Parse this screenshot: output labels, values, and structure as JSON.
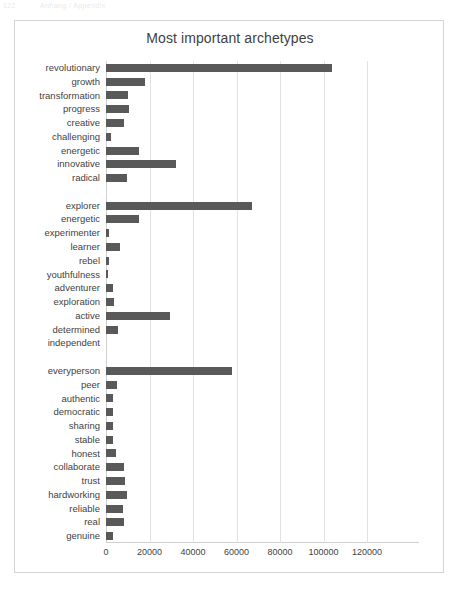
{
  "page_artifact": {
    "number": "122",
    "text": "Anhang / Appendix"
  },
  "chart_data": {
    "type": "bar",
    "orientation": "horizontal",
    "title": "Most important archetypes",
    "xlabel": "",
    "ylabel": "",
    "xlim": [
      0,
      120000
    ],
    "xticks": [
      0,
      20000,
      40000,
      60000,
      80000,
      100000,
      120000
    ],
    "xtick_labels": [
      "0",
      "20000",
      "40000",
      "60000",
      "80000",
      "100000",
      "120000"
    ],
    "grid": "vertical",
    "legend": "none",
    "bar_color": "#595959",
    "gridline_color": "#e2e2e2",
    "plot_border_color": "#d4d4d4",
    "groups": [
      {
        "name": "revolutionary-group",
        "categories": [
          "revolutionary",
          "growth",
          "transformation",
          "progress",
          "creative",
          "challenging",
          "energetic",
          "innovative",
          "radical"
        ],
        "values": [
          104000,
          18000,
          10000,
          10500,
          8500,
          2500,
          15000,
          32000,
          9500
        ]
      },
      {
        "name": "explorer-group",
        "categories": [
          "explorer",
          "energetic",
          "experimenter",
          "learner",
          "rebel",
          "youthfulness",
          "adventurer",
          "exploration",
          "active",
          "determined",
          "independent"
        ],
        "values": [
          67000,
          15000,
          1200,
          6500,
          1200,
          500,
          3000,
          3800,
          29500,
          5500,
          0
        ]
      },
      {
        "name": "everyperson-group",
        "categories": [
          "everyperson",
          "peer",
          "authentic",
          "democratic",
          "sharing",
          "stable",
          "honest",
          "collaborate",
          "trust",
          "hardworking",
          "reliable",
          "real",
          "genuine"
        ],
        "values": [
          58000,
          5200,
          3200,
          3100,
          3300,
          3100,
          4500,
          8500,
          8800,
          9500,
          8000,
          8300,
          3000
        ]
      }
    ],
    "categories": [
      "revolutionary",
      "growth",
      "transformation",
      "progress",
      "creative",
      "challenging",
      "energetic",
      "innovative",
      "radical",
      "",
      "explorer",
      "energetic",
      "experimenter",
      "learner",
      "rebel",
      "youthfulness",
      "adventurer",
      "exploration",
      "active",
      "determined",
      "independent",
      "",
      "everyperson",
      "peer",
      "authentic",
      "democratic",
      "sharing",
      "stable",
      "honest",
      "collaborate",
      "trust",
      "hardworking",
      "reliable",
      "real",
      "genuine"
    ],
    "values": [
      104000,
      18000,
      10000,
      10500,
      8500,
      2500,
      15000,
      32000,
      9500,
      null,
      67000,
      15000,
      1200,
      6500,
      1200,
      500,
      3000,
      3800,
      29500,
      5500,
      0,
      null,
      58000,
      5200,
      3200,
      3100,
      3300,
      3100,
      4500,
      8500,
      8800,
      9500,
      8000,
      8300,
      3000
    ]
  }
}
